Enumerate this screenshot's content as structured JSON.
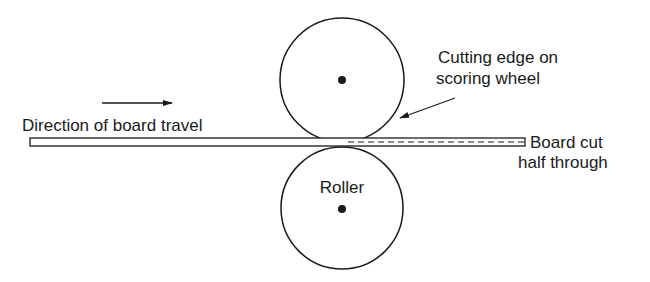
{
  "diagram": {
    "labels": {
      "direction": "Direction of board travel",
      "cutting_edge_line1": "Cutting edge on",
      "cutting_edge_line2": "scoring wheel",
      "board_cut_line1": "Board cut",
      "board_cut_line2": "half through",
      "roller": "Roller"
    },
    "components": [
      "scoring-wheel",
      "roller",
      "board",
      "score-line",
      "direction-arrow",
      "pointer-arrow"
    ],
    "colors": {
      "ink": "#1a1a1a",
      "background": "#ffffff"
    }
  }
}
